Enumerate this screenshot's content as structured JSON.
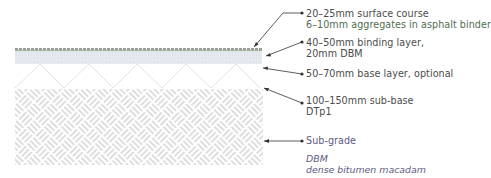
{
  "diagram": {
    "colors": {
      "surface_line": "#7a7a7a",
      "surface_tint": "#9db59d",
      "binding_fill": "#e6e9ef",
      "zigzag": "#e2e2e2",
      "weave": "#b5b5b5",
      "leader": "#333333",
      "label_text": "#4b4b4b",
      "legend_text": "#5c5b80"
    },
    "layers": [
      {
        "id": "surface",
        "label_lines": [
          "20–25mm surface course",
          "6–10mm aggregates in asphalt binder"
        ]
      },
      {
        "id": "binding",
        "label_lines": [
          "40–50mm binding layer,",
          "20mm DBM"
        ]
      },
      {
        "id": "base",
        "label_lines": [
          "50–70mm base layer, optional"
        ]
      },
      {
        "id": "sub-base",
        "label_lines": [
          "100–150mm sub-base",
          "DTp1"
        ]
      },
      {
        "id": "sub-grade",
        "label_lines": [
          "Sub-grade"
        ]
      }
    ],
    "legend": {
      "abbr": "DBM",
      "meaning": "dense bitumen macadam"
    }
  }
}
